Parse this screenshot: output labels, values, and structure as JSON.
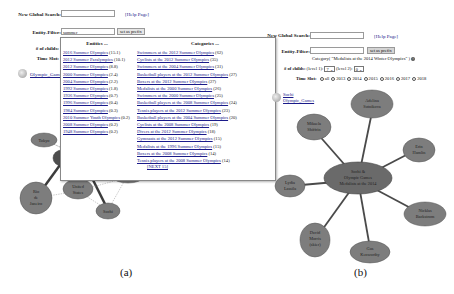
{
  "panel_a": {
    "global_search_label": "New Global Search:",
    "global_search_value": "",
    "help_link": "[Help Page]",
    "entity_filter_label": "Entity-Filter:",
    "entity_filter_value": "summer",
    "set_prefix_button": "set as prefix",
    "children_label": "# of childs:",
    "time_slot_label": "Time Slot:",
    "root_link": "Olympic_Games",
    "dropdown": {
      "entities_header": "Entities ...",
      "categories_header": "Categories ...",
      "entities": [
        {
          "name": "2016 Summer Olympics",
          "score": "(15.1)"
        },
        {
          "name": "2012 Summer Paralympics",
          "score": "(10.1)"
        },
        {
          "name": "2012 Summer Olympics",
          "score": "(8.8)"
        },
        {
          "name": "2000 Summer Olympics",
          "score": "(2.4)"
        },
        {
          "name": "2004 Summer Olympics",
          "score": "(2.2)"
        },
        {
          "name": "1992 Summer Olympics",
          "score": "(1.8)"
        },
        {
          "name": "1936 Summer Olympics",
          "score": "(0.7)"
        },
        {
          "name": "1996 Summer Olympics",
          "score": "(0.4)"
        },
        {
          "name": "1984 Summer Olympics",
          "score": "(0.3)"
        },
        {
          "name": "2010 Summer Youth Olympics",
          "score": "(0.2)"
        },
        {
          "name": "2008 Summer Olympics",
          "score": "(0.2)"
        },
        {
          "name": "1948 Summer Olympics",
          "score": "(0.2)"
        }
      ],
      "categories": [
        {
          "name": "Swimmers at the 2012 Summer Olympics",
          "count": "(62)"
        },
        {
          "name": "Cyclists at the 2012 Summer Olympics",
          "count": "(35)"
        },
        {
          "name": "Swimmers at the 2004 Summer Olympics",
          "count": "(31)"
        },
        {
          "name": "Basketball players at the 2012 Summer Olympics",
          "count": "(27)"
        },
        {
          "name": "Boxers at the 2012 Summer Olympics",
          "count": "(27)"
        },
        {
          "name": "Medalists at the 2000 Summer Olympics",
          "count": "(26)"
        },
        {
          "name": "Swimmers at the 2000 Summer Olympics",
          "count": "(25)"
        },
        {
          "name": "Basketball players at the 2008 Summer Olympics",
          "count": "(24)"
        },
        {
          "name": "Tennis players at the 2012 Summer Olympics",
          "count": "(23)"
        },
        {
          "name": "Basketball players at the 2004 Summer Olympics",
          "count": "(20)"
        },
        {
          "name": "Cyclists at the 2008 Summer Olympics",
          "count": "(19)"
        },
        {
          "name": "Divers at the 2012 Summer Olympics",
          "count": "(18)"
        },
        {
          "name": "Gymnasts at the 2012 Summer Olympics",
          "count": "(15)"
        },
        {
          "name": "Medalists at the 1996 Summer Olympics",
          "count": "(15)"
        },
        {
          "name": "Boxers at the 2008 Summer Olympics",
          "count": "(14)"
        },
        {
          "name": "Tennis players at the 2008 Summer Olympics",
          "count": "(14)"
        }
      ],
      "next_link": "[NEXT 15]"
    },
    "graph_nodes": [
      {
        "label": "Tokyo"
      },
      {
        "label": "Rio de Janeiro"
      },
      {
        "label": "United States"
      },
      {
        "label": "Sochi"
      }
    ],
    "caption": "(a)"
  },
  "panel_b": {
    "global_search_label": "New Global Search:",
    "global_search_value": "",
    "help_link": "[Help Page]",
    "entity_filter_label": "Entity-Filter:",
    "entity_filter_value": "",
    "set_prefix_button": "set as prefix",
    "category_text": "Category( \"Medalists at the 2014 Winter Olympics\" )",
    "children_label": "# of childs:",
    "level1_label": "(level 1):",
    "level1_value": "7",
    "level2_label": "(level 2):",
    "level2_value": "0",
    "time_slot_label": "Time Slot:",
    "time_slots": [
      {
        "label": "all",
        "selected": true
      },
      {
        "label": "2013",
        "selected": false
      },
      {
        "label": "2014",
        "selected": false
      },
      {
        "label": "2015",
        "selected": false
      },
      {
        "label": "2016",
        "selected": false
      },
      {
        "label": "2017",
        "selected": false
      },
      {
        "label": "2018",
        "selected": false
      }
    ],
    "breadcrumb_top": "Sochi",
    "breadcrumb_bottom": "Olympic_Games",
    "center_node": "Sochi & Olympic Games Medalists at the 2014 Winter Olympics",
    "center_lines": [
      "Sochi &",
      "Olympic Games",
      "Medalists at the 2014"
    ],
    "graph_nodes": [
      {
        "lines": [
          "Adelina",
          "Sotnikova"
        ]
      },
      {
        "lines": [
          "Mikaela",
          "Shiffrin"
        ]
      },
      {
        "lines": [
          "Erin",
          "Hamlin"
        ]
      },
      {
        "lines": [
          "Lydia",
          "Lassila"
        ]
      },
      {
        "lines": [
          "Nicklas",
          "Backstrom"
        ]
      },
      {
        "lines": [
          "David",
          "Morris",
          "(skier)"
        ]
      },
      {
        "lines": [
          "Gus",
          "Kenworthy"
        ]
      }
    ],
    "caption": "(b)"
  },
  "colors": {
    "node_fill": "#7d7d7d",
    "node_stroke": "#555555",
    "edge": "#4a4a4a",
    "link": "#1a1a8a"
  }
}
